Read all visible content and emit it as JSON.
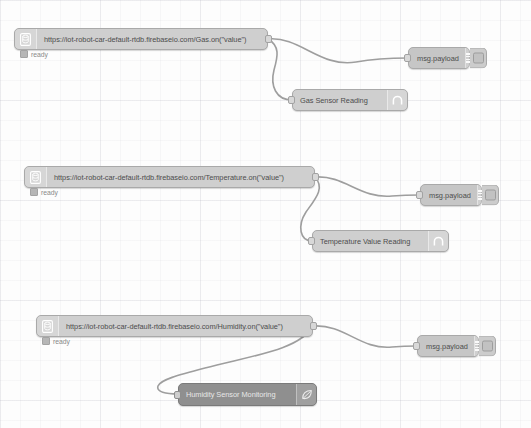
{
  "editor": {
    "name": "node-red-flow-canvas",
    "background_color": "#fdfdfd",
    "wire_color": "#9e9e9e",
    "node_color": "#cfcfcf",
    "dark_node_color": "#8f8f8f"
  },
  "flows": [
    {
      "id": "gas",
      "source": {
        "label": "https://iot-robot-car-default-rtdb.firebaseio.com/Gas.on(\"value\")",
        "icon": "database-icon",
        "status": "ready"
      },
      "debug": {
        "label": "msg.payload",
        "icon": "debug-bars-icon",
        "toggle": "debug-toggle-button"
      },
      "func": {
        "label": "Gas Sensor Reading",
        "icon": "function-icon"
      }
    },
    {
      "id": "temperature",
      "source": {
        "label": "https://iot-robot-car-default-rtdb.firebaseio.com/Temperature.on(\"value\")",
        "icon": "database-icon",
        "status": "ready"
      },
      "debug": {
        "label": "msg.payload",
        "icon": "debug-bars-icon",
        "toggle": "debug-toggle-button"
      },
      "func": {
        "label": "Temperature Value Reading",
        "icon": "function-icon"
      }
    },
    {
      "id": "humidity",
      "source": {
        "label": "https://iot-robot-car-default-rtdb.firebaseio.com/Humidity.on(\"value\")",
        "icon": "database-icon",
        "status": "ready"
      },
      "debug": {
        "label": "msg.payload",
        "icon": "debug-bars-icon",
        "toggle": "debug-toggle-button"
      },
      "func": {
        "label": "Humidity Sensor Monitoring",
        "icon": "leaf-icon"
      }
    }
  ]
}
